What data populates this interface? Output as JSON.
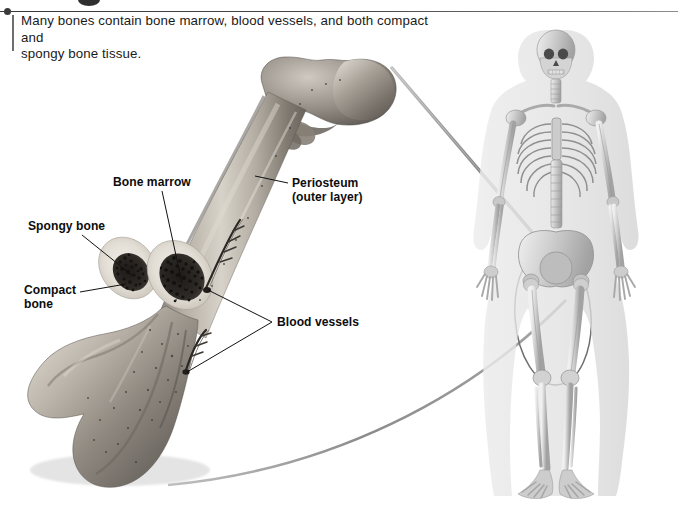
{
  "figure": {
    "caption": "Many bones contain bone marrow, blood vessels, and both compact and spongy bone tissue.",
    "caption_line_1": "Many bones contain bone marrow, blood vessels, and both compact and",
    "caption_line_2": "spongy bone tissue."
  },
  "labels": {
    "bone_marrow": "Bone marrow",
    "spongy_bone": "Spongy bone",
    "compact_bone_line_1": "Compact",
    "compact_bone_line_2": "bone",
    "compact_bone": "Compact bone",
    "periosteum_line_1": "Periosteum",
    "periosteum_line_2": "(outer layer)",
    "periosteum": "Periosteum (outer layer)",
    "blood_vessels": "Blood vessels"
  },
  "illustrations": {
    "femur_photo": "enlarged-cut-femur-photograph",
    "skeleton": "human-skeleton-front-view",
    "highlight": "femur-highlight-ellipse",
    "connector_upper": "upper-magnification-connector",
    "connector_lower": "lower-magnification-connector"
  },
  "colors": {
    "page_background": "#ffffff",
    "rule": "#3a3a3a",
    "caption_text": "#1a1a1a",
    "label_text": "#0d0d0d",
    "leader_line": "#1a1a1a",
    "connector_line": "#8a8a8a",
    "bone_light": "#e8e4dd",
    "bone_mid": "#b9b3a9",
    "bone_dark": "#6d6761",
    "marrow_dark": "#262220",
    "skeleton_bone": "#c9c9c9",
    "skeleton_body": "#e4e4e4"
  }
}
